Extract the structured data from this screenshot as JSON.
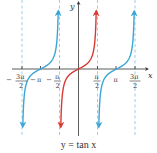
{
  "chart_data": {
    "type": "line",
    "title": "y = tan x",
    "xlabel": "x",
    "ylabel": "y",
    "function": "tan(x)",
    "x_ticks": [
      {
        "value": -4.712,
        "label_num": "3π",
        "label_den": "2",
        "sign": "−"
      },
      {
        "value": -3.1416,
        "label": "−π"
      },
      {
        "value": -1.5708,
        "label_num": "π",
        "label_den": "2",
        "sign": "−"
      },
      {
        "value": 1.5708,
        "label_num": "π",
        "label_den": "2",
        "sign": ""
      },
      {
        "value": 3.1416,
        "label": "π"
      },
      {
        "value": 4.712,
        "label_num": "3π",
        "label_den": "2",
        "sign": ""
      }
    ],
    "asymptotes": [
      -4.712,
      -1.5708,
      1.5708,
      4.712
    ],
    "series": [
      {
        "name": "left branch",
        "domain": [
          -4.712,
          -1.5708
        ],
        "color": "#3aa6d6"
      },
      {
        "name": "principal branch",
        "domain": [
          -1.5708,
          1.5708
        ],
        "color": "#d93a34"
      },
      {
        "name": "right branch",
        "domain": [
          1.5708,
          4.712
        ],
        "color": "#3aa6d6"
      }
    ],
    "xlim": [
      -5.9,
      5.6
    ],
    "ylim": [
      -5.6,
      5.6
    ],
    "grid": false,
    "legend": "none"
  },
  "labels": {
    "x_axis": "x",
    "y_axis": "y",
    "caption": "y = tan x",
    "neg_three_pi_half_num": "3π",
    "neg_three_pi_half_den": "2",
    "neg_pi": "π",
    "neg_pi_half_num": "π",
    "neg_pi_half_den": "2",
    "pi_half_num": "π",
    "pi_half_den": "2",
    "pi": "π",
    "three_pi_half_num": "3π",
    "three_pi_half_den": "2",
    "minus": "−"
  },
  "colors": {
    "blue": "#3aa6d6",
    "red": "#d93a34",
    "axis": "#333333",
    "asymptote": "#7cc3e3"
  }
}
